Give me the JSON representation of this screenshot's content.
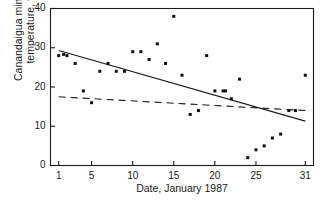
{
  "chart_data": {
    "type": "scatter",
    "title": "",
    "xlabel": "Date, January 1987",
    "ylabel": "Canandaigua minimum temperature, °F",
    "ylabel_line1": "Canandaigua minimum",
    "ylabel_line2": "temperature, °F",
    "xlim": [
      0,
      32
    ],
    "ylim": [
      0,
      40
    ],
    "xticks": [
      1,
      5,
      10,
      15,
      20,
      25,
      31
    ],
    "xtick_labels": [
      "1",
      "5",
      "10",
      "15",
      "20",
      "25",
      "31"
    ],
    "yticks": [
      0,
      10,
      20,
      30,
      40
    ],
    "ytick_labels": [
      "0",
      "10",
      "20",
      "30",
      "40"
    ],
    "grid": false,
    "legend": "none",
    "marker_color": "#111111",
    "marker_shape": "filled-square",
    "points": [
      {
        "x": 1,
        "y": 28
      },
      {
        "x": 1.6,
        "y": 28.3
      },
      {
        "x": 2,
        "y": 28
      },
      {
        "x": 3,
        "y": 26
      },
      {
        "x": 4,
        "y": 19
      },
      {
        "x": 5,
        "y": 16
      },
      {
        "x": 6,
        "y": 24
      },
      {
        "x": 7,
        "y": 26
      },
      {
        "x": 8,
        "y": 24
      },
      {
        "x": 9,
        "y": 24
      },
      {
        "x": 10,
        "y": 29
      },
      {
        "x": 11,
        "y": 29
      },
      {
        "x": 12,
        "y": 27
      },
      {
        "x": 13,
        "y": 31
      },
      {
        "x": 14,
        "y": 26
      },
      {
        "x": 15,
        "y": 38
      },
      {
        "x": 16,
        "y": 23
      },
      {
        "x": 17,
        "y": 13
      },
      {
        "x": 18,
        "y": 14
      },
      {
        "x": 19,
        "y": 28
      },
      {
        "x": 20,
        "y": 19
      },
      {
        "x": 21,
        "y": 19
      },
      {
        "x": 21.3,
        "y": 19
      },
      {
        "x": 22,
        "y": 17
      },
      {
        "x": 23,
        "y": 22
      },
      {
        "x": 24,
        "y": 2
      },
      {
        "x": 25,
        "y": 4
      },
      {
        "x": 26,
        "y": 5
      },
      {
        "x": 27,
        "y": 7
      },
      {
        "x": 28,
        "y": 8
      },
      {
        "x": 29,
        "y": 14
      },
      {
        "x": 29.8,
        "y": 14
      },
      {
        "x": 31,
        "y": 23
      }
    ],
    "lines": [
      {
        "name": "solid-regression-line",
        "style": "solid",
        "color": "#1a1a1a",
        "x0": 1,
        "y0": 29.3,
        "x1": 31,
        "y1": 11.3
      },
      {
        "name": "dashed-regression-line",
        "style": "dashed",
        "color": "#1a1a1a",
        "x0": 1,
        "y0": 17.5,
        "x1": 31,
        "y1": 14.0
      }
    ]
  }
}
